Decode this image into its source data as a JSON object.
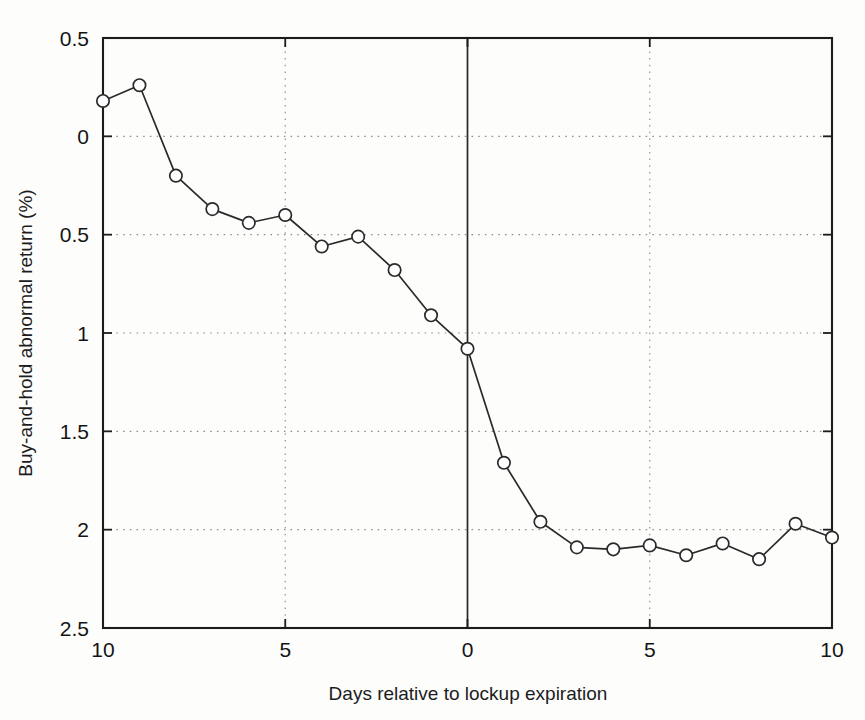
{
  "figure": {
    "background_color": "#fdfdfc",
    "line_color": "#2a2a2a",
    "marker_fill": "#ffffff",
    "grid_color": "#8a8a8a",
    "axis_color": "#1c1c1c"
  },
  "chart_data": {
    "type": "line",
    "title": "",
    "subtitle": "",
    "xlabel": "Days relative to lockup expiration",
    "ylabel": "Buy-and-hold abnormal return (%)",
    "xlim": [
      -10,
      10
    ],
    "ylim": [
      -2.5,
      0.5
    ],
    "y_axis_inverted": true,
    "grid": true,
    "grid_axes": "both",
    "legend": "none",
    "marker": "circle-open",
    "x": [
      -10,
      -9,
      -8,
      -7,
      -6,
      -5,
      -4,
      -3,
      -2,
      -1,
      0,
      1,
      2,
      3,
      4,
      5,
      6,
      7,
      8,
      9,
      10
    ],
    "y": [
      0.18,
      0.26,
      -0.2,
      -0.37,
      -0.44,
      -0.4,
      -0.56,
      -0.51,
      -0.68,
      -0.91,
      -1.08,
      -1.66,
      -1.96,
      -2.09,
      -2.1,
      -2.08,
      -2.13,
      -2.07,
      -2.15,
      -1.97,
      -2.04
    ],
    "series": [
      {
        "name": "Buy-and-hold abnormal return",
        "values": [
          0.18,
          0.26,
          -0.2,
          -0.37,
          -0.44,
          -0.4,
          -0.56,
          -0.51,
          -0.68,
          -0.91,
          -1.08,
          -1.66,
          -1.96,
          -2.09,
          -2.1,
          -2.08,
          -2.13,
          -2.07,
          -2.15,
          -1.97,
          -2.04
        ]
      }
    ],
    "x_ticks": [
      -10,
      -5,
      0,
      5,
      10
    ],
    "x_tick_labels": [
      "10",
      "5",
      "0",
      "5",
      "10"
    ],
    "y_ticks": [
      0.5,
      0,
      -0.5,
      -1,
      -1.5,
      -2,
      -2.5
    ],
    "y_tick_labels": [
      "0.5",
      "0",
      "0.5",
      "1",
      "1.5",
      "2",
      "2.5"
    ],
    "annotations": [
      {
        "type": "vertical-reference-line",
        "x": 0,
        "style": "solid",
        "label": "lockup expiration day"
      }
    ]
  },
  "axes": {
    "x_title": "Days relative to lockup expiration",
    "y_title": "Buy-and-hold abnormal return (%)"
  }
}
